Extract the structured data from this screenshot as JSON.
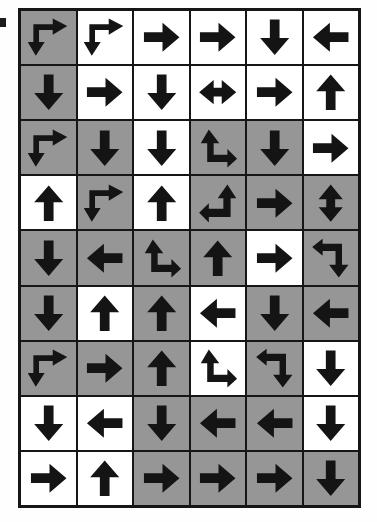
{
  "image": {
    "title": "Arrow direction grid",
    "kind": "arrow-grid-worksheet",
    "rows": 9,
    "columns": 6,
    "background_color": "#ffffff",
    "cell_shaded_color": "#969696",
    "cell_plain_color": "#ffffff",
    "arrow_color": "#141414",
    "grid_line_color": "#161616"
  },
  "legend": {
    "shading_values": [
      "white",
      "gray"
    ],
    "arrow_types": [
      "up",
      "down",
      "left",
      "right",
      "left-right",
      "up-down",
      "bend-right-down",
      "bend-up-right",
      "bend-up-left",
      "bend-left-down"
    ]
  },
  "grid": {
    "cells": [
      [
        {
          "shade": "gray",
          "arrow": "bend-right-down"
        },
        {
          "shade": "white",
          "arrow": "bend-right-down"
        },
        {
          "shade": "white",
          "arrow": "right"
        },
        {
          "shade": "white",
          "arrow": "right"
        },
        {
          "shade": "white",
          "arrow": "down"
        },
        {
          "shade": "white",
          "arrow": "left"
        }
      ],
      [
        {
          "shade": "gray",
          "arrow": "down"
        },
        {
          "shade": "white",
          "arrow": "right"
        },
        {
          "shade": "white",
          "arrow": "down"
        },
        {
          "shade": "white",
          "arrow": "left-right"
        },
        {
          "shade": "white",
          "arrow": "right"
        },
        {
          "shade": "white",
          "arrow": "up"
        }
      ],
      [
        {
          "shade": "gray",
          "arrow": "bend-right-down"
        },
        {
          "shade": "gray",
          "arrow": "down"
        },
        {
          "shade": "white",
          "arrow": "down"
        },
        {
          "shade": "gray",
          "arrow": "bend-up-right"
        },
        {
          "shade": "gray",
          "arrow": "down"
        },
        {
          "shade": "white",
          "arrow": "right"
        }
      ],
      [
        {
          "shade": "white",
          "arrow": "up"
        },
        {
          "shade": "gray",
          "arrow": "bend-right-down"
        },
        {
          "shade": "white",
          "arrow": "up"
        },
        {
          "shade": "gray",
          "arrow": "bend-up-left"
        },
        {
          "shade": "gray",
          "arrow": "right"
        },
        {
          "shade": "gray",
          "arrow": "up-down"
        }
      ],
      [
        {
          "shade": "gray",
          "arrow": "down"
        },
        {
          "shade": "gray",
          "arrow": "left"
        },
        {
          "shade": "gray",
          "arrow": "bend-up-right"
        },
        {
          "shade": "gray",
          "arrow": "up"
        },
        {
          "shade": "white",
          "arrow": "right"
        },
        {
          "shade": "gray",
          "arrow": "bend-left-down"
        }
      ],
      [
        {
          "shade": "gray",
          "arrow": "down"
        },
        {
          "shade": "white",
          "arrow": "up"
        },
        {
          "shade": "gray",
          "arrow": "up"
        },
        {
          "shade": "white",
          "arrow": "left"
        },
        {
          "shade": "gray",
          "arrow": "down"
        },
        {
          "shade": "gray",
          "arrow": "left"
        }
      ],
      [
        {
          "shade": "gray",
          "arrow": "bend-right-down"
        },
        {
          "shade": "gray",
          "arrow": "right"
        },
        {
          "shade": "gray",
          "arrow": "up"
        },
        {
          "shade": "white",
          "arrow": "bend-up-right"
        },
        {
          "shade": "gray",
          "arrow": "bend-left-down"
        },
        {
          "shade": "white",
          "arrow": "down"
        }
      ],
      [
        {
          "shade": "white",
          "arrow": "down"
        },
        {
          "shade": "white",
          "arrow": "left"
        },
        {
          "shade": "gray",
          "arrow": "down"
        },
        {
          "shade": "gray",
          "arrow": "left"
        },
        {
          "shade": "gray",
          "arrow": "left"
        },
        {
          "shade": "white",
          "arrow": "down"
        }
      ],
      [
        {
          "shade": "white",
          "arrow": "right"
        },
        {
          "shade": "white",
          "arrow": "up"
        },
        {
          "shade": "gray",
          "arrow": "right"
        },
        {
          "shade": "gray",
          "arrow": "right"
        },
        {
          "shade": "gray",
          "arrow": "right"
        },
        {
          "shade": "gray",
          "arrow": "down"
        }
      ]
    ]
  }
}
